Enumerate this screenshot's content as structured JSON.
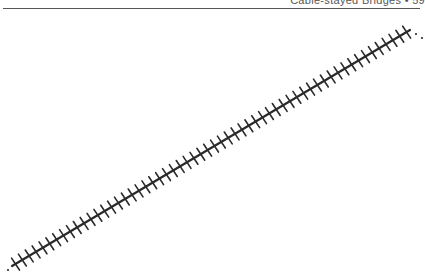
{
  "header": {
    "running_title": "Cable-stayed Bridges • 59"
  },
  "figure": {
    "line_color": "#2a2a2a",
    "start": [
      12,
      266
    ],
    "end": [
      410,
      30
    ],
    "tick_count": 58,
    "tick_half_length": 7
  }
}
